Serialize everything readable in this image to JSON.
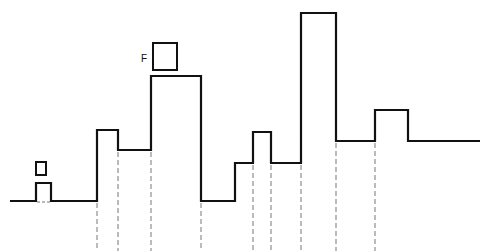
{
  "diagram": {
    "type": "step-waveform",
    "stroke_color": "#111111",
    "dash_color": "#777777",
    "label_F": "F",
    "waveform_points": [
      [
        10,
        201
      ],
      [
        36,
        201
      ],
      [
        36,
        183
      ],
      [
        51,
        183
      ],
      [
        51,
        201
      ],
      [
        97,
        201
      ],
      [
        97,
        130
      ],
      [
        118,
        130
      ],
      [
        118,
        150
      ],
      [
        151,
        150
      ],
      [
        151,
        76
      ],
      [
        201,
        76
      ],
      [
        201,
        201
      ],
      [
        235,
        201
      ],
      [
        235,
        163
      ],
      [
        253,
        163
      ],
      [
        253,
        132
      ],
      [
        271,
        132
      ],
      [
        271,
        163
      ],
      [
        301,
        163
      ],
      [
        301,
        13
      ],
      [
        336,
        13
      ],
      [
        336,
        141
      ],
      [
        375,
        141
      ],
      [
        375,
        110
      ],
      [
        408,
        110
      ],
      [
        408,
        141
      ],
      [
        480,
        141
      ]
    ],
    "dashed_guides_x": [
      97,
      118,
      151,
      201,
      253,
      271,
      301,
      336,
      375
    ],
    "dashed_guides_tops": [
      201,
      150,
      150,
      201,
      163,
      163,
      163,
      141,
      141
    ],
    "small_square": {
      "x": 36,
      "y": 162,
      "w": 10,
      "h": 13
    },
    "f_box": {
      "x": 153,
      "y": 43,
      "w": 24,
      "h": 27
    }
  }
}
